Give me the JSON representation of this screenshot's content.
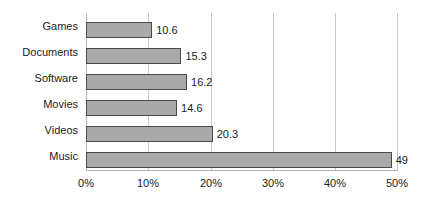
{
  "chart_data": {
    "type": "bar",
    "orientation": "horizontal",
    "title": "",
    "subtitle": "",
    "xlabel": "",
    "ylabel": "",
    "categories": [
      "Games",
      "Documents",
      "Software",
      "Movies",
      "Videos",
      "Music"
    ],
    "values": [
      10.6,
      15.3,
      16.2,
      14.6,
      20.3,
      49
    ],
    "value_labels": [
      "10.6",
      "15.3",
      "16.2",
      "14.6",
      "20.3",
      "49"
    ],
    "xlim": [
      0,
      50
    ],
    "xticks": [
      0,
      10,
      20,
      30,
      40,
      50
    ],
    "xtick_labels": [
      "0%",
      "10%",
      "20%",
      "30%",
      "40%",
      "50%"
    ],
    "grid": "vertical",
    "legend": "none",
    "bar_fill_color": "#a9a9a9",
    "bar_border_color": "#4a4a4a",
    "gridline_color": "#c9c9c9",
    "axis_color": "#b0b0b0",
    "text_color": "#1b1b1b",
    "background_color": "#ffffff"
  }
}
